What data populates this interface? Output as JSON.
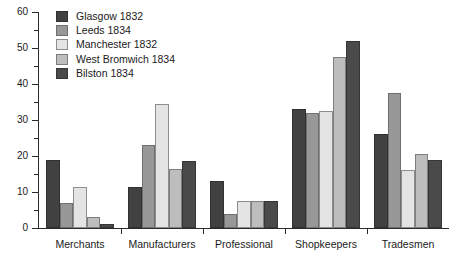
{
  "chart_data": {
    "type": "bar",
    "title": "",
    "xlabel": "",
    "ylabel": "",
    "ylim": [
      0,
      60
    ],
    "ytick_step": 10,
    "yminor_step": 5,
    "grid": false,
    "legend_position": "top-left",
    "categories": [
      "Merchants",
      "Manufacturers",
      "Professional",
      "Shopkeepers",
      "Tradesmen"
    ],
    "ytick_labels": [
      "0",
      "10",
      "20",
      "30",
      "40",
      "50",
      "60"
    ],
    "series": [
      {
        "name": "Glasgow 1832",
        "color": "#414141",
        "edge": "#303030",
        "values": [
          19,
          11.5,
          13,
          33,
          26
        ]
      },
      {
        "name": "Leeds 1834",
        "color": "#989898",
        "edge": "#6f6f6f",
        "values": [
          7,
          23,
          4,
          32,
          37.5
        ]
      },
      {
        "name": "Manchester 1832",
        "color": "#e4e4e4",
        "edge": "#8d8d8d",
        "values": [
          11.5,
          34.5,
          7.5,
          32.5,
          16
        ]
      },
      {
        "name": "West Bromwich 1834",
        "color": "#bdbdbd",
        "edge": "#7e7e7e",
        "values": [
          3,
          16.5,
          7.5,
          47.5,
          20.5
        ]
      },
      {
        "name": "Bilston 1834",
        "color": "#4a4a4a",
        "edge": "#363636",
        "values": [
          1,
          18.5,
          7.5,
          52,
          19
        ]
      }
    ]
  }
}
